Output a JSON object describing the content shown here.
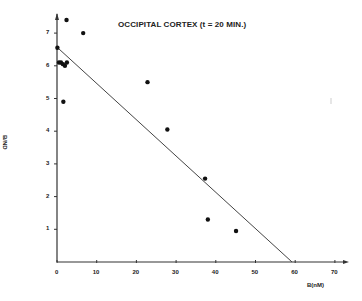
{
  "chart_data": {
    "type": "scatter",
    "title": "OCCIPITAL CORTEX (t = 20 MIN.)",
    "xlabel": "B(nM)",
    "ylabel": "B/ND",
    "xlim": [
      0,
      70
    ],
    "ylim": [
      0,
      7.5
    ],
    "x_ticks": [
      0,
      10,
      20,
      30,
      40,
      50,
      60,
      70
    ],
    "y_ticks": [
      1,
      2,
      3,
      4,
      5,
      6,
      7
    ],
    "grid": false,
    "legend": null,
    "points": [
      {
        "x": 2.4,
        "y": 7.4
      },
      {
        "x": 6.6,
        "y": 7.0
      },
      {
        "x": 0.1,
        "y": 6.55
      },
      {
        "x": 0.5,
        "y": 6.1
      },
      {
        "x": 1.0,
        "y": 6.1
      },
      {
        "x": 1.5,
        "y": 6.05
      },
      {
        "x": 2.0,
        "y": 6.0
      },
      {
        "x": 2.5,
        "y": 6.1
      },
      {
        "x": 1.6,
        "y": 4.9
      },
      {
        "x": 22.8,
        "y": 5.5
      },
      {
        "x": 27.8,
        "y": 4.05
      },
      {
        "x": 37.3,
        "y": 2.55
      },
      {
        "x": 38.0,
        "y": 1.3
      },
      {
        "x": 45.1,
        "y": 0.95
      }
    ],
    "fit_line": {
      "x": [
        0,
        59.2
      ],
      "y": [
        6.57,
        0
      ]
    }
  }
}
